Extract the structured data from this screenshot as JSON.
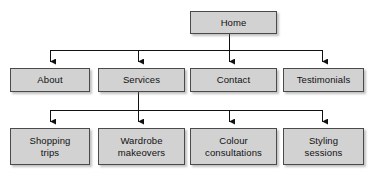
{
  "diagram": {
    "type": "site-map-tree",
    "canvas": {
      "width": 372,
      "height": 177
    },
    "style": {
      "box_fill": "#d2d2d2",
      "box_border": "#4a4a4a",
      "connector_color": "#111111",
      "text_color": "#111111",
      "background": "#ffffff"
    },
    "levels": [
      {
        "level": 1,
        "nodes": [
          {
            "id": "home",
            "label": "Home",
            "x": 190,
            "y": 11,
            "w": 87,
            "h": 23
          }
        ]
      },
      {
        "level": 2,
        "nodes": [
          {
            "id": "about",
            "label": "About",
            "x": 10,
            "y": 68,
            "w": 80,
            "h": 24
          },
          {
            "id": "services",
            "label": "Services",
            "x": 98,
            "y": 68,
            "w": 87,
            "h": 24
          },
          {
            "id": "contact",
            "label": "Contact",
            "x": 190,
            "y": 68,
            "w": 87,
            "h": 24
          },
          {
            "id": "testimonials",
            "label": "Testimonials",
            "x": 283,
            "y": 68,
            "w": 81,
            "h": 24
          }
        ]
      },
      {
        "level": 3,
        "nodes": [
          {
            "id": "shopping-trips",
            "label": "Shopping\ntrips",
            "x": 10,
            "y": 128,
            "w": 80,
            "h": 37
          },
          {
            "id": "wardrobe-makeovers",
            "label": "Wardrobe\nmakeovers",
            "x": 98,
            "y": 128,
            "w": 87,
            "h": 37
          },
          {
            "id": "colour-consultations",
            "label": "Colour\nconsultations",
            "x": 190,
            "y": 128,
            "w": 87,
            "h": 37
          },
          {
            "id": "styling-sessions",
            "label": "Styling\nsessions",
            "x": 283,
            "y": 128,
            "w": 81,
            "h": 37
          }
        ]
      }
    ],
    "connectors": {
      "bus_1": {
        "y": 50,
        "x_start": 50,
        "x_end": 323,
        "from": "home",
        "stem_x": 229
      },
      "bus_2": {
        "y": 110,
        "x_start": 50,
        "x_end": 323,
        "from": "services",
        "stem_x": 138
      },
      "drop_columns": [
        50,
        138,
        229,
        323
      ]
    },
    "edges": [
      {
        "from": "home",
        "to": "about"
      },
      {
        "from": "home",
        "to": "services"
      },
      {
        "from": "home",
        "to": "contact"
      },
      {
        "from": "home",
        "to": "testimonials"
      },
      {
        "from": "services",
        "to": "shopping-trips"
      },
      {
        "from": "services",
        "to": "wardrobe-makeovers"
      },
      {
        "from": "services",
        "to": "colour-consultations"
      },
      {
        "from": "services",
        "to": "styling-sessions"
      }
    ]
  }
}
